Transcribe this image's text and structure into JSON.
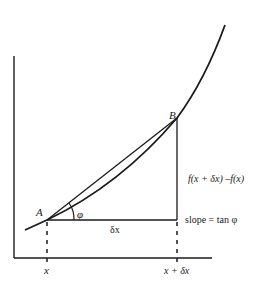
{
  "diagram": {
    "type": "derivative-secant-diagram",
    "points": {
      "A": {
        "label": "A"
      },
      "B": {
        "label": "B"
      }
    },
    "labels": {
      "angle": "φ",
      "delta_x": "δx",
      "rise": "f(x + δx) –f(x)",
      "slope": "slope = tan φ",
      "x_tick_1": "x",
      "x_tick_2": "x + δx"
    },
    "colors": {
      "line": "#1a1a1a",
      "background": "#ffffff"
    }
  }
}
